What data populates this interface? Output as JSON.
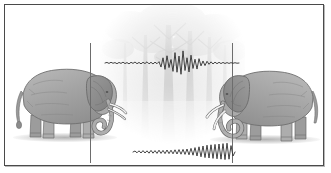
{
  "figure": {
    "background_color": "#ffffff",
    "frame_color": "#4a4a4a",
    "ink_color": "#3a3a3a",
    "reference_line_color": "#6d6d6d",
    "elephant_body_color": "#a9a9a9",
    "elephant_shade_color": "#8a8a8a",
    "tusk_color": "#f2f2f2"
  },
  "backdrop": {
    "name": "forest-backdrop",
    "description": "faded grayscale forest of tall trees",
    "opacity": 0.55
  },
  "subjects": [
    {
      "id": "elephant-left",
      "label": "Left elephant",
      "facing": "right",
      "reference_line_x": 85
    },
    {
      "id": "elephant-right",
      "label": "Right elephant",
      "facing": "left",
      "reference_line_x": 227
    }
  ],
  "chart_data": [
    {
      "type": "line",
      "id": "waveform-upper",
      "title": "",
      "xlabel": "",
      "ylabel": "",
      "grid": false,
      "legend": "none",
      "description": "Near-flat trace with a short high-amplitude burst at the center",
      "x": [
        0,
        2,
        4,
        6,
        8,
        10,
        12,
        14,
        16,
        18,
        20,
        22,
        24,
        26,
        28,
        30,
        32,
        34,
        36,
        38,
        40,
        42,
        44,
        46,
        48,
        50,
        52,
        54,
        56,
        58,
        60,
        62,
        64,
        66,
        68,
        70,
        72,
        74,
        76,
        78,
        80,
        82,
        84,
        86,
        88,
        90,
        92,
        94,
        96,
        98,
        100,
        102,
        104,
        106,
        108,
        110,
        112,
        114,
        116,
        118,
        120,
        122,
        124,
        126,
        128,
        130,
        132,
        134
      ],
      "values": [
        0,
        0.4,
        -0.3,
        0.5,
        -0.2,
        0.3,
        -0.5,
        0.4,
        -0.3,
        0.6,
        -0.4,
        0.3,
        -0.6,
        0.5,
        -0.3,
        0.7,
        -0.5,
        0.4,
        -0.6,
        0.5,
        -0.4,
        0.8,
        -0.6,
        0.5,
        -0.7,
        0.6,
        -0.5,
        0.9,
        -2.8,
        3.6,
        -4.4,
        5.0,
        -3.2,
        2.4,
        -5.8,
        7.2,
        -6.4,
        4.8,
        -7.8,
        8.4,
        -5.2,
        3.6,
        -6.2,
        5.4,
        -3.8,
        2.6,
        -4.2,
        3.0,
        -2.0,
        1.4,
        -1.8,
        1.2,
        -0.9,
        0.8,
        -0.7,
        0.6,
        -0.5,
        0.5,
        -0.4,
        0.4,
        -0.35,
        0.3,
        -0.3,
        0.25,
        -0.2,
        0.2,
        -0.15,
        0
      ],
      "ylim": [
        -9,
        9
      ]
    },
    {
      "type": "line",
      "id": "waveform-lower",
      "title": "",
      "xlabel": "",
      "ylabel": "",
      "grid": false,
      "legend": "none",
      "description": "Low-amplitude ripple growing into larger oscillations toward the right",
      "x": [
        0,
        2,
        4,
        6,
        8,
        10,
        12,
        14,
        16,
        18,
        20,
        22,
        24,
        26,
        28,
        30,
        32,
        34,
        36,
        38,
        40,
        42,
        44,
        46,
        48,
        50,
        52,
        54,
        56,
        58,
        60,
        62,
        64,
        66,
        68,
        70,
        72,
        74,
        76,
        78,
        80,
        82,
        84,
        86,
        88,
        90,
        92,
        94,
        96,
        98,
        100,
        102
      ],
      "values": [
        0,
        0.5,
        -0.4,
        0.6,
        -0.5,
        0.7,
        -0.5,
        0.6,
        -0.6,
        0.8,
        -0.6,
        0.7,
        -0.7,
        0.9,
        -0.7,
        0.8,
        -0.8,
        1.0,
        -0.8,
        0.9,
        -0.9,
        1.1,
        -1.0,
        1.2,
        -1.1,
        1.3,
        -1.2,
        1.5,
        -1.4,
        1.8,
        -1.6,
        2.2,
        -2.0,
        2.6,
        -2.4,
        3.0,
        -2.8,
        3.4,
        -3.0,
        3.6,
        -3.2,
        3.8,
        -3.4,
        4.0,
        -3.6,
        4.2,
        -3.8,
        4.4,
        -3.6,
        3.2,
        -2.0,
        0
      ],
      "ylim": [
        -5,
        5
      ]
    }
  ]
}
